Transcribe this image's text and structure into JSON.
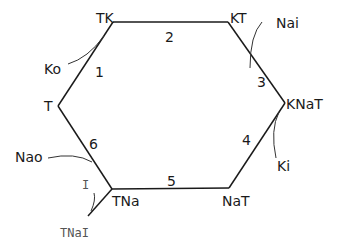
{
  "diagram": {
    "type": "state-cycle",
    "states": [
      {
        "id": "TK",
        "label": "TK"
      },
      {
        "id": "KT",
        "label": "KT"
      },
      {
        "id": "KNaT",
        "label": "KNaT"
      },
      {
        "id": "NaT",
        "label": "NaT"
      },
      {
        "id": "TNa",
        "label": "TNa"
      },
      {
        "id": "T",
        "label": "T"
      },
      {
        "id": "TNaI",
        "label": "TNaI"
      }
    ],
    "transitions": [
      {
        "number": "1",
        "from": "T",
        "to": "TK"
      },
      {
        "number": "2",
        "from": "TK",
        "to": "KT"
      },
      {
        "number": "3",
        "from": "KT",
        "to": "KNaT"
      },
      {
        "number": "4",
        "from": "KNaT",
        "to": "NaT"
      },
      {
        "number": "5",
        "from": "NaT",
        "to": "TNa"
      },
      {
        "number": "6",
        "from": "TNa",
        "to": "T"
      }
    ],
    "ligands": [
      {
        "label": "Ko",
        "transition": "1"
      },
      {
        "label": "Nai",
        "transition": "3"
      },
      {
        "label": "Ki",
        "transition": "4"
      },
      {
        "label": "Nao",
        "transition": "6"
      },
      {
        "label": "I",
        "transition": "TNa-TNaI"
      }
    ]
  }
}
